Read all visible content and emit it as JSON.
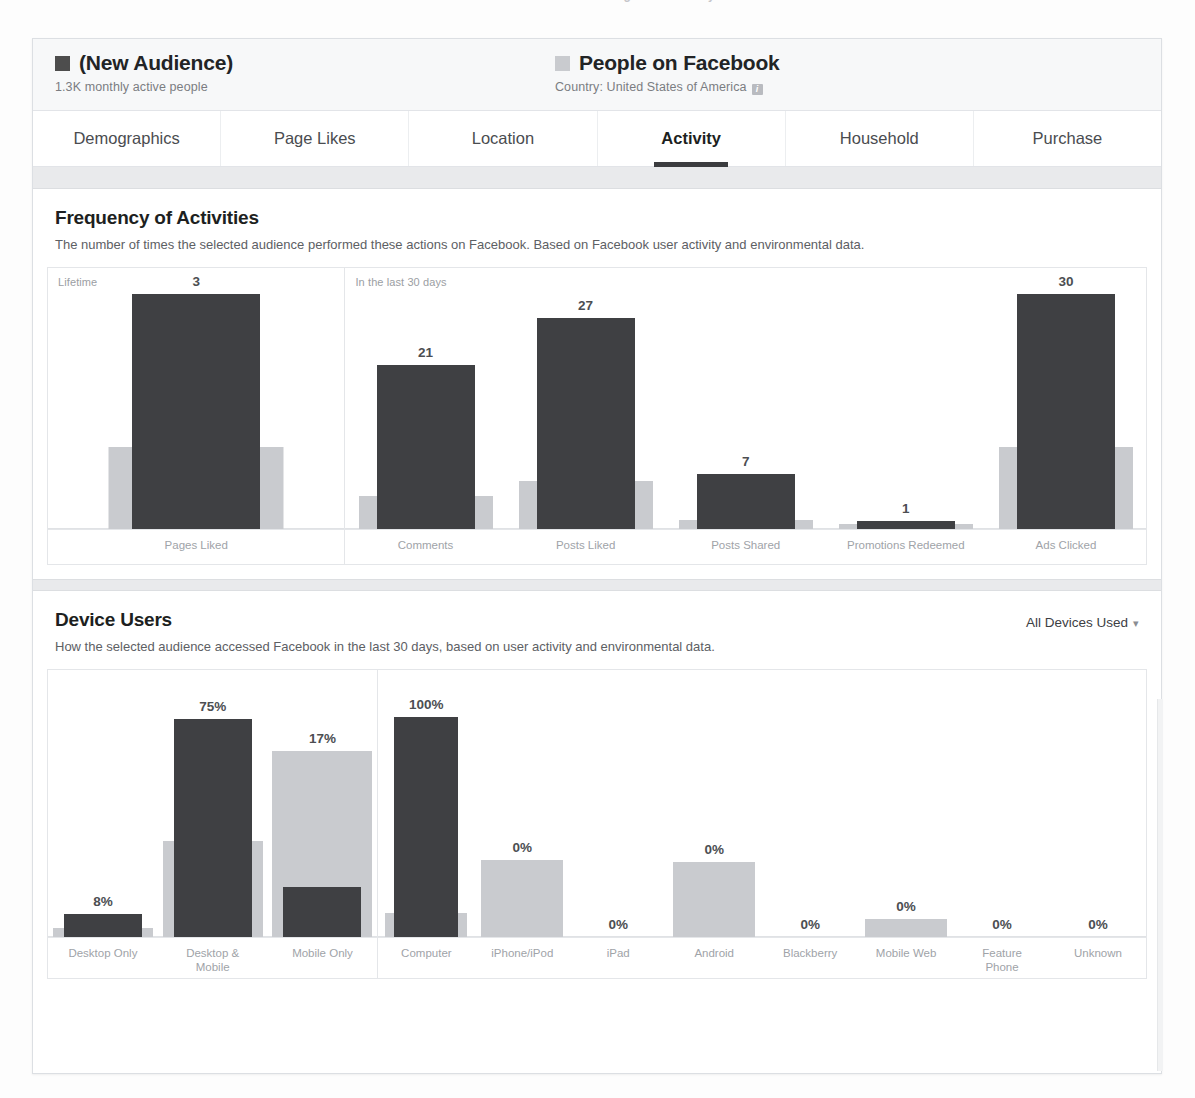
{
  "top_text": "Facebook Audience Insights — Activity",
  "header": {
    "left": {
      "swatch_color": "#4d4d4d",
      "title": "(New Audience)",
      "subtitle": "1.3K monthly active people"
    },
    "right": {
      "swatch_color": "#c9cbcf",
      "title": "People on Facebook",
      "subtitle": "Country: United States of America",
      "info_badge": "i"
    }
  },
  "tabs": [
    {
      "label": "Demographics",
      "active": false
    },
    {
      "label": "Page Likes",
      "active": false
    },
    {
      "label": "Location",
      "active": false
    },
    {
      "label": "Activity",
      "active": true
    },
    {
      "label": "Household",
      "active": false
    },
    {
      "label": "Purchase",
      "active": false
    }
  ],
  "frequency_section": {
    "title": "Frequency of Activities",
    "description": "The number of times the selected audience performed these actions on Facebook. Based on Facebook user activity and environmental data.",
    "panel_labels": [
      "Lifetime",
      "In the last 30 days"
    ]
  },
  "device_section": {
    "title": "Device Users",
    "description": "How the selected audience accessed Facebook in the last 30 days, based on user activity and environmental data.",
    "dropdown_label": "All Devices Used",
    "dropdown_caret": "▾"
  },
  "colors": {
    "selected_audience": "#3f4043",
    "comparison_audience": "#c9cbcf",
    "card_border": "#dcdfe3",
    "band": "#e9eaec"
  },
  "chart_data": [
    {
      "type": "bar",
      "title": "Frequency of Activities",
      "subcharts": [
        {
          "panel_label": "Lifetime",
          "categories": [
            "Pages Liked"
          ],
          "series": [
            {
              "name": "(New Audience)",
              "values": [
                3
              ],
              "labels": [
                "3"
              ],
              "color": "#3f4043"
            },
            {
              "name": "People on Facebook",
              "values": [
                1.05
              ],
              "labels": [
                ""
              ],
              "color": "#c9cbcf"
            }
          ],
          "ymax": 3.35
        },
        {
          "panel_label": "In the last 30 days",
          "categories": [
            "Comments",
            "Posts Liked",
            "Posts Shared",
            "Promotions Redeemed",
            "Ads Clicked"
          ],
          "series": [
            {
              "name": "(New Audience)",
              "values": [
                21,
                27,
                7,
                1,
                30
              ],
              "labels": [
                "21",
                "27",
                "7",
                "1",
                "30"
              ],
              "color": "#3f4043"
            },
            {
              "name": "People on Facebook",
              "values": [
                4.2,
                6.2,
                1.2,
                0.7,
                10.5
              ],
              "labels": [
                "",
                "",
                "",
                "",
                ""
              ],
              "color": "#c9cbcf"
            }
          ],
          "ymax": 33.5
        }
      ],
      "xlabel": "",
      "ylabel": "",
      "grid": false,
      "legend": "top"
    },
    {
      "type": "bar",
      "title": "Device Users",
      "subcharts": [
        {
          "panel_label": "",
          "categories": [
            "Desktop Only",
            "Desktop &\nMobile",
            "Mobile Only"
          ],
          "series": [
            {
              "name": "(New Audience)",
              "values": [
                8,
                75,
                17
              ],
              "labels": [
                "8%",
                "75%",
                "17%"
              ],
              "color": "#3f4043"
            },
            {
              "name": "People on Facebook",
              "values": [
                3,
                33,
                64
              ],
              "labels": [
                "",
                "",
                ""
              ],
              "color": "#c9cbcf"
            }
          ],
          "ymax": 92,
          "unit": "%"
        },
        {
          "panel_label": "",
          "categories": [
            "Computer",
            "iPhone/iPod",
            "iPad",
            "Android",
            "Blackberry",
            "Mobile Web",
            "Feature\nPhone",
            "Unknown"
          ],
          "series": [
            {
              "name": "(New Audience)",
              "values": [
                100,
                0,
                0,
                0,
                0,
                0,
                0,
                0
              ],
              "labels": [
                "100%",
                "0%",
                "0%",
                "0%",
                "0%",
                "0%",
                "0%",
                "0%"
              ],
              "color": "#3f4043"
            },
            {
              "name": "People on Facebook",
              "values": [
                11,
                35,
                0,
                34,
                0,
                8,
                0,
                0
              ],
              "labels": [
                "",
                "",
                "",
                "",
                "",
                "",
                "",
                ""
              ],
              "color": "#c9cbcf"
            }
          ],
          "ymax": 122,
          "unit": "%"
        }
      ],
      "xlabel": "",
      "ylabel": "",
      "grid": false,
      "legend": "top"
    }
  ]
}
